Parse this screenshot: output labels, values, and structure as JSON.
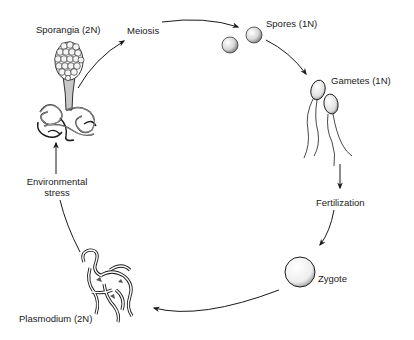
{
  "diagram": {
    "stages": [
      {
        "id": "sporangia",
        "label": "Sporangia (2N)"
      },
      {
        "id": "meiosis",
        "label": "Meiosis"
      },
      {
        "id": "spores",
        "label": "Spores (1N)"
      },
      {
        "id": "gametes",
        "label": "Gametes (1N)"
      },
      {
        "id": "fertilization",
        "label": "Fertilization"
      },
      {
        "id": "zygote",
        "label": "Zygote"
      },
      {
        "id": "plasmodium",
        "label": "Plasmodium (2N)"
      },
      {
        "id": "environmental_stress",
        "label_line1": "Environmental",
        "label_line2": "stress"
      }
    ],
    "flow": [
      "Sporangia (2N) -> Meiosis",
      "Meiosis -> Spores (1N)",
      "Spores (1N) -> Gametes (1N)",
      "Gametes (1N) -> Fertilization",
      "Fertilization -> Zygote",
      "Zygote -> Plasmodium (2N)",
      "Plasmodium (2N) -> Environmental stress",
      "Environmental stress -> Sporangia (2N)"
    ],
    "colors": {
      "line": "#1a1a1a",
      "background": "#ffffff",
      "shade": "#9a9a9a"
    }
  }
}
